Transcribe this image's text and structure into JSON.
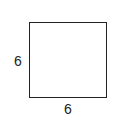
{
  "diagram": {
    "shape": "square",
    "side_labels": {
      "left": "6",
      "bottom": "6"
    }
  }
}
